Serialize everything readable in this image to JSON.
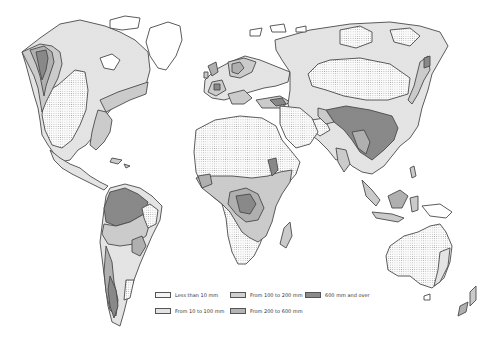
{
  "map": {
    "type": "world-choropleth",
    "subject": "precipitation",
    "style": "grayscale-hatched",
    "colors": {
      "outline": "#4a4a4a",
      "land_unshaded": "#ffffff",
      "cat_lt10": "#f2f2f2",
      "cat_10_100": "#e3e3e3",
      "cat_100_200": "#cfcfcf",
      "cat_200_600": "#b4b4b4",
      "cat_600_plus": "#8a8a8a",
      "ocean": "#ffffff"
    }
  },
  "legend": {
    "items": [
      {
        "id": "lt10",
        "label": "Less than 10 mm",
        "pattern": "dotted",
        "color": "#f2f2f2"
      },
      {
        "id": "10_100",
        "label": "From 10 to 100 mm",
        "pattern": "light-stipple",
        "color": "#e3e3e3"
      },
      {
        "id": "100_200",
        "label": "From 100 to 200 mm",
        "pattern": "stipple",
        "color": "#cfcfcf"
      },
      {
        "id": "200_600",
        "label": "From 200 to 600 mm",
        "pattern": "dense-stipple",
        "color": "#b4b4b4"
      },
      {
        "id": "600_plus",
        "label": "600 mm and over",
        "pattern": "dark",
        "color": "#8a8a8a"
      }
    ]
  }
}
